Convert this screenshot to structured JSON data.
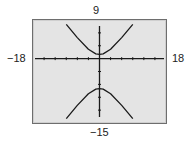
{
  "window_labels": {
    "ymax": "9",
    "ymin": "−15",
    "xmin": "−18",
    "xmax": "18"
  },
  "colors": {
    "screen_bg": "#e4e4e4",
    "border": "#6e6e6e",
    "curve": "#1a1a1a",
    "axis": "#1a1a1a"
  },
  "chart_data": {
    "type": "line",
    "title": "",
    "xlabel": "",
    "ylabel": "",
    "xlim": [
      -18,
      18
    ],
    "ylim": [
      -15,
      9
    ],
    "xscale_ticks": 3,
    "yscale_ticks": 3,
    "grid": false,
    "legend": null,
    "series": [
      {
        "name": "upper branch",
        "x": [
          -9,
          -6,
          -3,
          -1,
          0,
          1,
          3,
          6,
          9
        ],
        "y": [
          8,
          4.9,
          2.2,
          1.1,
          1,
          1.1,
          2.2,
          4.9,
          8
        ]
      },
      {
        "name": "lower branch",
        "x": [
          -9,
          -6,
          -3,
          -1,
          0,
          1,
          3,
          6,
          9
        ],
        "y": [
          -14,
          -10.9,
          -8.2,
          -7.1,
          -7,
          -7.1,
          -8.2,
          -10.9,
          -14
        ]
      }
    ]
  }
}
